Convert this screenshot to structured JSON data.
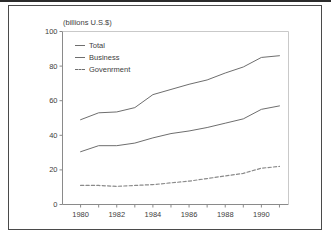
{
  "figure": {
    "unit_label": "(billions U.S.$)"
  },
  "chart_data": {
    "type": "line",
    "title": "",
    "subtitle": "",
    "xlabel": "",
    "ylabel": "(billions U.S.$)",
    "ylim": [
      0,
      100
    ],
    "xlim": [
      1979,
      1991.5
    ],
    "yticks": [
      0,
      20,
      40,
      60,
      80,
      100
    ],
    "ytick_labels": [
      "0",
      "20",
      "40",
      "60",
      "80",
      "100"
    ],
    "xticks": [
      1980,
      1981,
      1982,
      1983,
      1984,
      1985,
      1986,
      1987,
      1988,
      1989,
      1990,
      1991
    ],
    "xtick_labels_shown": [
      "1980",
      "1982",
      "1984",
      "1986",
      "1988",
      "1990"
    ],
    "xtick_labels_shown_values": [
      1980,
      1982,
      1984,
      1986,
      1988,
      1990
    ],
    "grid": false,
    "legend_position": "top-left",
    "x": [
      1980,
      1981,
      1982,
      1983,
      1984,
      1985,
      1986,
      1987,
      1988,
      1989,
      1990,
      1991
    ],
    "series": [
      {
        "name": "Total",
        "style": "solid",
        "color": "#6e6e6e",
        "values": [
          49,
          53,
          53.5,
          56,
          63.5,
          66.5,
          69.5,
          72,
          76,
          79.5,
          85,
          86
        ]
      },
      {
        "name": "Business",
        "style": "solid",
        "color": "#6e6e6e",
        "values": [
          30.5,
          34,
          34,
          35.5,
          38.5,
          41,
          42.5,
          44.5,
          47,
          49.5,
          55,
          57
        ]
      },
      {
        "name": "Govenrment",
        "style": "dashed",
        "color": "#8a8a8a",
        "values": [
          11,
          11,
          10.5,
          11,
          11.5,
          12.5,
          13.5,
          15,
          16.5,
          18,
          21,
          22
        ]
      }
    ]
  },
  "legend": {
    "items": [
      {
        "label": "Total"
      },
      {
        "label": "Business"
      },
      {
        "label": "Govenrment"
      }
    ]
  },
  "colors": {
    "frame": "#4a4a4a",
    "axis": "#8a8a8a",
    "text": "#3d3d3d",
    "line": "#6e6e6e",
    "background": "#ffffff"
  }
}
